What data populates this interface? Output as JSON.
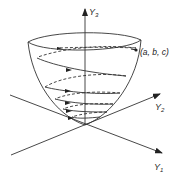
{
  "diagram": {
    "type": "3d-paraboloid-with-helical-trajectory",
    "axes": {
      "y1": {
        "label": "Y",
        "subscript": "1"
      },
      "y2": {
        "label": "Y",
        "subscript": "2"
      },
      "y3": {
        "label": "Y",
        "subscript": "3"
      }
    },
    "point_label": "(a, b, c)",
    "colors": {
      "stroke": "#333333",
      "background": "#ffffff"
    }
  }
}
